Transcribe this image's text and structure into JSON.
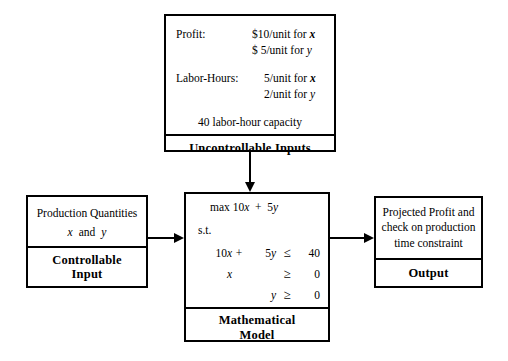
{
  "diagram": {
    "line_color": "#000000",
    "background_color": "#ffffff"
  },
  "uncontrollable_inputs": {
    "footer_label": "Uncontrollable Inputs",
    "rows": [
      {
        "label": "Profit:",
        "values": [
          "$10/unit for x",
          "$ 5/unit for y"
        ],
        "value_numbers": [
          "$10",
          "$ 5"
        ],
        "value_variables": [
          "x",
          "y"
        ]
      },
      {
        "label": "Labor-Hours:",
        "values": [
          "5/unit for x",
          "2/unit for y"
        ],
        "value_numbers": [
          "5",
          "2"
        ],
        "value_variables": [
          "x",
          "y"
        ]
      }
    ],
    "capacity_line": "40 labor-hour capacity"
  },
  "controllable_input": {
    "line1": "Production Quantities",
    "line2_parts": [
      "x",
      "and",
      "y"
    ],
    "footer_label_line1": "Controllable",
    "footer_label_line2": "Input"
  },
  "mathematical_model": {
    "objective": "max 10x + 5y",
    "objective_prefix": "max",
    "subject_to": "s.t.",
    "constraints": [
      {
        "lhs1": "10x",
        "op": "+",
        "lhs2": "5 y",
        "relation": "≤",
        "rhs": "40"
      },
      {
        "lhs1": "x",
        "op": "",
        "lhs2": "",
        "relation": "≥",
        "rhs": "0"
      },
      {
        "lhs1": "",
        "op": "",
        "lhs2": "y",
        "relation": "≥",
        "rhs": "0"
      }
    ],
    "footer_label_line1": "Mathematical",
    "footer_label_line2": "Model"
  },
  "output": {
    "line1": "Projected Profit and",
    "line2": "check on production",
    "line3": "time constraint",
    "footer_label": "Output"
  },
  "connectors": [
    {
      "name": "uncontrollable-inputs-to-model",
      "direction": "down"
    },
    {
      "name": "controllable-input-to-model",
      "direction": "right"
    },
    {
      "name": "model-to-output",
      "direction": "right"
    }
  ]
}
